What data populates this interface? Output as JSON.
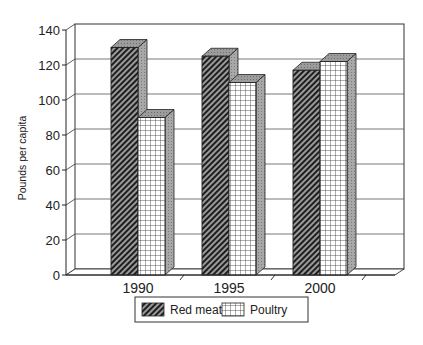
{
  "chart_data": {
    "type": "bar",
    "title": "",
    "xlabel": "",
    "ylabel": "Pounds per capita",
    "categories": [
      "1990",
      "1995",
      "2000"
    ],
    "series": [
      {
        "name": "Red meat",
        "values": [
          130,
          125,
          117
        ],
        "pattern": "diagonal-hatch",
        "color": "#3a3a3a"
      },
      {
        "name": "Poultry",
        "values": [
          90,
          110,
          122
        ],
        "pattern": "grid",
        "color": "#ffffff"
      }
    ],
    "ylim": [
      0,
      140
    ],
    "yticks": [
      0,
      20,
      40,
      60,
      80,
      100,
      120,
      140
    ],
    "grid": true,
    "three_d": true,
    "legend_position": "bottom"
  },
  "legend": {
    "items": [
      {
        "label": "Red meat"
      },
      {
        "label": "Poultry"
      }
    ]
  }
}
